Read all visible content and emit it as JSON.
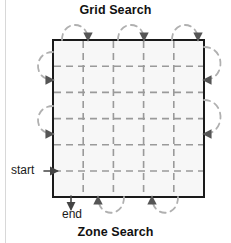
{
  "figure": {
    "title_top": "Grid Search",
    "title_bottom": "Zone Search",
    "labels": {
      "start": "start",
      "end": "end"
    },
    "colors": {
      "square_stroke": "#1a1a1a",
      "square_fill": "#f7f7f7",
      "grid_dash": "#9a9a9a",
      "path_dash": "#b0b0b0",
      "arrow": "#555555",
      "text": "#111111",
      "page_edge": "#d8d8d8"
    },
    "square": {
      "x": 53,
      "y": 40,
      "width": 151,
      "height": 157,
      "stroke_width": 2
    },
    "grid": {
      "columns": 5,
      "rows": 5,
      "dash_pattern": "7 5",
      "stroke_width": 1.6
    },
    "search_pattern": {
      "type": "boustrophedon-lawnmower",
      "start_side": "left-lower",
      "end_side": "bottom",
      "top_arcs": 3,
      "right_arcs": 2,
      "bottom_arcs": 2,
      "left_arcs": 2
    }
  }
}
